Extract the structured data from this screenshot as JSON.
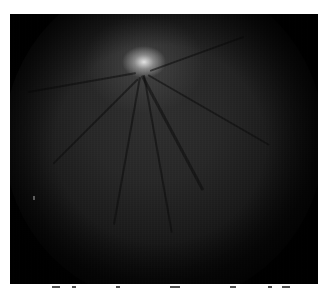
{
  "image": {
    "description": "Grayscale retinal fundus photograph on black frame",
    "features": {
      "optic_disc": {
        "x": 140,
        "y": 66,
        "appearance": "bright white blob"
      },
      "vessels": "dark branching vessels radiating downward from optic disc",
      "artifact_mark": {
        "x": 33,
        "y": 198
      }
    },
    "colors": {
      "frame": "#000000",
      "fundus_center": "#2e2e2e",
      "optic_disc": "#ebebeb",
      "page_background": "#ffffff"
    }
  },
  "caption": {
    "visible": "partially cropped, illegible"
  }
}
